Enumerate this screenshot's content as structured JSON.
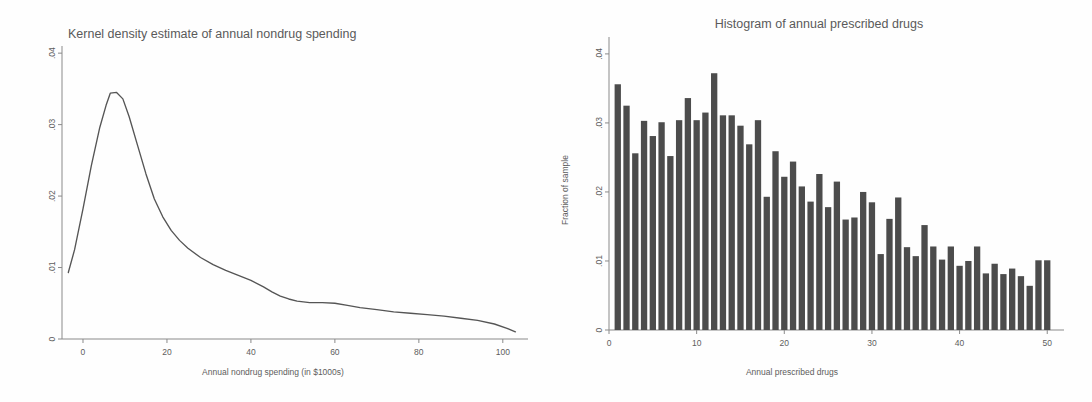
{
  "figure": {
    "background_color": "#fefefe",
    "ink_color": "#4c4c4c",
    "panels": [
      "kernel-density-nondrug-spending",
      "histogram-prescribed-drugs"
    ]
  },
  "chart_data": [
    {
      "type": "line",
      "id": "kernel-density-nondrug-spending",
      "title": "Kernel density estimate of annual nondrug spending",
      "xlabel": "Annual nondrug spending (in $1000s)",
      "ylabel": "",
      "xlim": [
        -5,
        106
      ],
      "ylim": [
        0,
        0.041
      ],
      "xticks": [
        0,
        20,
        40,
        60,
        80,
        100
      ],
      "xtick_labels": [
        "0",
        "20",
        "40",
        "60",
        "80",
        "100"
      ],
      "yticks": [
        0,
        0.01,
        0.02,
        0.03,
        0.04
      ],
      "ytick_labels": [
        "0",
        ".01",
        ".02",
        ".03",
        ".04"
      ],
      "grid": false,
      "legend": "none",
      "x": [
        -3.5,
        -2,
        0,
        2,
        4,
        5.5,
        6.5,
        8,
        9.5,
        11,
        13,
        15,
        17,
        19,
        21,
        23,
        25,
        28,
        31,
        34,
        37,
        40,
        43,
        45,
        47,
        49,
        51,
        54,
        57,
        60,
        63,
        66,
        70,
        74,
        78,
        82,
        86,
        90,
        94,
        98,
        101,
        103
      ],
      "y": [
        0.0093,
        0.0125,
        0.0182,
        0.0243,
        0.0296,
        0.0327,
        0.0344,
        0.0345,
        0.0336,
        0.0311,
        0.0271,
        0.0231,
        0.0196,
        0.0171,
        0.0152,
        0.0138,
        0.0127,
        0.0114,
        0.0104,
        0.0096,
        0.0089,
        0.0082,
        0.0073,
        0.0066,
        0.006,
        0.0056,
        0.0053,
        0.0051,
        0.0051,
        0.005,
        0.0047,
        0.0044,
        0.0041,
        0.0038,
        0.0036,
        0.0034,
        0.0032,
        0.0029,
        0.0026,
        0.0021,
        0.0015,
        0.001
      ]
    },
    {
      "type": "bar",
      "id": "histogram-prescribed-drugs",
      "title": "Histogram of annual prescribed drugs",
      "xlabel": "Annual prescribed drugs",
      "ylabel": "Fraction of sample",
      "xlim": [
        0,
        51
      ],
      "ylim": [
        0,
        0.041
      ],
      "xticks": [
        0,
        10,
        20,
        30,
        40,
        50
      ],
      "xtick_labels": [
        "0",
        "10",
        "20",
        "30",
        "40",
        "50"
      ],
      "yticks": [
        0,
        0.01,
        0.02,
        0.03,
        0.04
      ],
      "ytick_labels": [
        "0",
        ".01",
        ".02",
        ".03",
        ".04"
      ],
      "grid": false,
      "legend": "none",
      "categories": [
        1,
        2,
        3,
        4,
        5,
        6,
        7,
        8,
        9,
        10,
        11,
        12,
        13,
        14,
        15,
        16,
        17,
        18,
        19,
        20,
        21,
        22,
        23,
        24,
        25,
        26,
        27,
        28,
        29,
        30,
        31,
        32,
        33,
        34,
        35,
        36,
        37,
        38,
        39,
        40,
        41,
        42,
        43,
        44,
        45,
        46,
        47,
        48,
        49,
        50
      ],
      "values": [
        0.0356,
        0.0325,
        0.0256,
        0.0303,
        0.0281,
        0.0301,
        0.0252,
        0.0304,
        0.0336,
        0.0304,
        0.0315,
        0.0372,
        0.0311,
        0.0311,
        0.0296,
        0.0269,
        0.0304,
        0.0193,
        0.0259,
        0.0222,
        0.0244,
        0.0208,
        0.0186,
        0.0226,
        0.0178,
        0.0215,
        0.016,
        0.0163,
        0.02,
        0.0185,
        0.011,
        0.0161,
        0.0192,
        0.012,
        0.0107,
        0.0152,
        0.0121,
        0.0102,
        0.0121,
        0.0093,
        0.01,
        0.0121,
        0.0082,
        0.0096,
        0.0081,
        0.0089,
        0.0078,
        0.0064,
        0.0101,
        0.0101
      ]
    }
  ]
}
